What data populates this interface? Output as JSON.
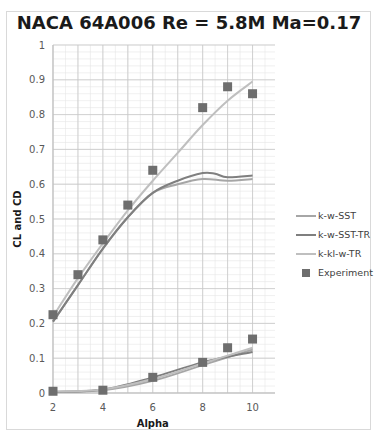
{
  "chart_data": {
    "type": "line",
    "title": "NACA 64A006 Re = 5.8M Ma=0.17",
    "xlabel": "Alpha",
    "ylabel": "CL and CD",
    "xlim": [
      2,
      10.9
    ],
    "ylim": [
      0,
      1
    ],
    "x_ticks": [
      "2",
      "4",
      "6",
      "8",
      "10"
    ],
    "y_ticks": [
      "0",
      "0.1",
      "0.2",
      "0.3",
      "0.4",
      "0.5",
      "0.6",
      "0.7",
      "0.8",
      "0.9",
      "1"
    ],
    "grid": true,
    "legend_position": "right",
    "series": [
      {
        "name": "k-w-SST",
        "kind": "line",
        "color": "#a6a6a6",
        "cl": {
          "x": [
            2,
            3,
            4,
            5,
            6,
            7,
            8,
            9,
            10
          ],
          "y": [
            0.205,
            0.31,
            0.415,
            0.505,
            0.575,
            0.6,
            0.615,
            0.61,
            0.615
          ]
        },
        "cd": {
          "x": [
            2,
            4,
            6,
            8,
            10
          ],
          "y": [
            0.003,
            0.008,
            0.035,
            0.08,
            0.125
          ]
        }
      },
      {
        "name": "k-w-SST-TR",
        "kind": "line",
        "color": "#7f7f7f",
        "cl": {
          "x": [
            2,
            3,
            4,
            5,
            6,
            7,
            8,
            8.5,
            9,
            10
          ],
          "y": [
            0.205,
            0.31,
            0.415,
            0.505,
            0.575,
            0.61,
            0.632,
            0.63,
            0.62,
            0.625
          ]
        },
        "cd": {
          "x": [
            2,
            4,
            6,
            8,
            10
          ],
          "y": [
            0.003,
            0.01,
            0.045,
            0.088,
            0.118
          ]
        }
      },
      {
        "name": "k-kl-w-TR",
        "kind": "line",
        "color": "#bfbfbf",
        "cl": {
          "x": [
            2,
            3,
            4,
            5,
            6,
            7,
            8,
            9,
            10
          ],
          "y": [
            0.22,
            0.33,
            0.43,
            0.525,
            0.61,
            0.69,
            0.77,
            0.84,
            0.895
          ]
        },
        "cd": {
          "x": [
            2,
            4,
            6,
            8,
            10
          ],
          "y": [
            0.004,
            0.01,
            0.04,
            0.085,
            0.13
          ]
        }
      },
      {
        "name": "Experiment",
        "kind": "marker",
        "color": "#6e6e6e",
        "cl": {
          "x": [
            2,
            3,
            4,
            5,
            6,
            8,
            9,
            10
          ],
          "y": [
            0.225,
            0.34,
            0.44,
            0.54,
            0.64,
            0.82,
            0.88,
            0.86
          ]
        },
        "cd": {
          "x": [
            2,
            4,
            6,
            8,
            9,
            10
          ],
          "y": [
            0.005,
            0.008,
            0.045,
            0.088,
            0.13,
            0.155
          ]
        }
      }
    ]
  }
}
